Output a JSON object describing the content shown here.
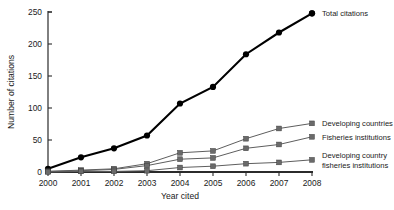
{
  "chart_data": {
    "type": "line",
    "title": "",
    "xlabel": "Year cited",
    "ylabel": "Number of citations",
    "categories": [
      "2000",
      "2001",
      "2002",
      "2003",
      "2004",
      "2005",
      "2006",
      "2007",
      "2008"
    ],
    "x": [
      2000,
      2001,
      2002,
      2003,
      2004,
      2005,
      2006,
      2007,
      2008
    ],
    "xlim": [
      2000,
      2008
    ],
    "ylim": [
      0,
      250
    ],
    "yticks": [
      0,
      50,
      100,
      150,
      200,
      250
    ],
    "xticks": [
      "2000",
      "2001",
      "2002",
      "2003",
      "2004",
      "2005",
      "2006",
      "2007",
      "2008"
    ],
    "grid": false,
    "legend_position": "right-inline-at-series-end",
    "series": [
      {
        "name": "Total citations",
        "marker": "filled-circle",
        "color": "#000000",
        "values": [
          5,
          23,
          37,
          57,
          107,
          133,
          184,
          218,
          248
        ]
      },
      {
        "name": "Developing countries",
        "marker": "filled-square",
        "color": "#6a6a6a",
        "values": [
          1,
          3,
          5,
          13,
          30,
          33,
          52,
          68,
          76
        ]
      },
      {
        "name": "Fisheries institutions",
        "marker": "filled-square",
        "color": "#6a6a6a",
        "values": [
          1,
          2,
          4,
          10,
          20,
          22,
          37,
          43,
          55
        ]
      },
      {
        "name": "Developing country fisheries institutions",
        "marker": "filled-square",
        "color": "#6a6a6a",
        "values": [
          0,
          1,
          1,
          2,
          7,
          9,
          13,
          15,
          19
        ]
      }
    ]
  },
  "axis": {
    "y_title": "Number of citations",
    "x_title": "Year cited",
    "y_tick_labels": [
      "0",
      "50",
      "100",
      "150",
      "200",
      "250"
    ],
    "x_tick_labels": [
      "2000",
      "2001",
      "2002",
      "2003",
      "2004",
      "2005",
      "2006",
      "2007",
      "2008"
    ]
  },
  "legend": {
    "items": [
      {
        "label": "Total citations",
        "line1": "Total citations",
        "line2": ""
      },
      {
        "label": "Developing countries",
        "line1": "Developing countries",
        "line2": ""
      },
      {
        "label": "Fisheries institutions",
        "line1": "Fisheries institutions",
        "line2": ""
      },
      {
        "label": "Developing country fisheries institutions",
        "line1": "Developing country",
        "line2": "fisheries institutions"
      }
    ]
  }
}
